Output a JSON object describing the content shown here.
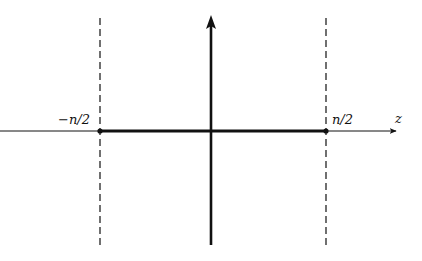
{
  "diagram": {
    "axis_label_horizontal": "z",
    "left_boundary_label": "−n/2",
    "right_boundary_label": "n/2",
    "colors": {
      "ink": "#111111",
      "background": "#ffffff"
    },
    "geometry": {
      "horizontal_axis_y": 131,
      "vertical_axis_x": 211,
      "left_boundary_x": 100,
      "right_boundary_x": 326,
      "top_y": 18,
      "bottom_y": 245,
      "axis_start_x": 0,
      "axis_end_x": 398
    }
  }
}
